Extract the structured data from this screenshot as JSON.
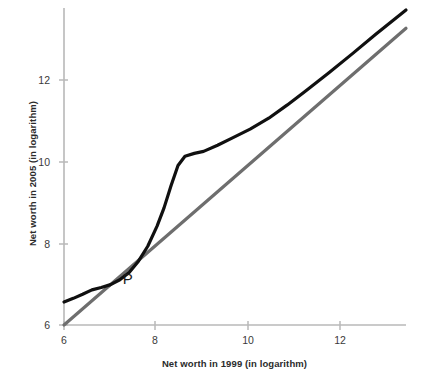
{
  "chart_data": {
    "type": "line",
    "title": "",
    "xlabel": "Net worth in 1999 (in  logarithm)",
    "ylabel": "Net worth in 2005 (in logarithm)",
    "xlim": [
      6,
      13.35
    ],
    "ylim": [
      6,
      13.85
    ],
    "xticks": [
      6,
      8,
      10,
      12
    ],
    "yticks": [
      6,
      8,
      10,
      12
    ],
    "xtick_labels": [
      "6",
      "8",
      "10",
      "12"
    ],
    "ytick_labels": [
      "6",
      "8",
      "10",
      "12"
    ],
    "grid": false,
    "legend": "none",
    "annotations": [
      {
        "text": "P",
        "x": 7.35,
        "y": 7.15,
        "description": "label marking the crossing point of the transition curve and the 45-degree line"
      }
    ],
    "series": [
      {
        "name": "Transition curve (net worth 2005 vs 1999)",
        "color": "#101010",
        "linewidth": 3.2,
        "points": [
          [
            6.0,
            6.57
          ],
          [
            6.2,
            6.66
          ],
          [
            6.4,
            6.76
          ],
          [
            6.6,
            6.87
          ],
          [
            6.8,
            6.93
          ],
          [
            7.0,
            7.0
          ],
          [
            7.2,
            7.12
          ],
          [
            7.4,
            7.3
          ],
          [
            7.6,
            7.58
          ],
          [
            7.8,
            7.95
          ],
          [
            8.0,
            8.45
          ],
          [
            8.15,
            8.9
          ],
          [
            8.3,
            9.45
          ],
          [
            8.45,
            9.95
          ],
          [
            8.6,
            10.18
          ],
          [
            8.8,
            10.25
          ],
          [
            9.0,
            10.3
          ],
          [
            9.3,
            10.45
          ],
          [
            9.6,
            10.62
          ],
          [
            10.0,
            10.85
          ],
          [
            10.4,
            11.12
          ],
          [
            10.8,
            11.45
          ],
          [
            11.2,
            11.8
          ],
          [
            11.7,
            12.25
          ],
          [
            12.2,
            12.72
          ],
          [
            12.7,
            13.2
          ],
          [
            13.35,
            13.8
          ]
        ]
      },
      {
        "name": "45-degree identity line",
        "color": "#6e6e6e",
        "linewidth": 3.2,
        "points": [
          [
            6.0,
            6.0
          ],
          [
            13.35,
            13.35
          ]
        ]
      }
    ],
    "axis_color": "#b4b4b4"
  },
  "axes": {
    "y_title": "Net worth in 2005 (in logarithm)",
    "x_title": "Net worth in 1999 (in  logarithm)",
    "y_ticks": [
      "12",
      "10",
      "8",
      "6"
    ],
    "x_ticks": [
      "6",
      "8",
      "10",
      "12"
    ]
  },
  "annotation": {
    "p_label": "P"
  }
}
